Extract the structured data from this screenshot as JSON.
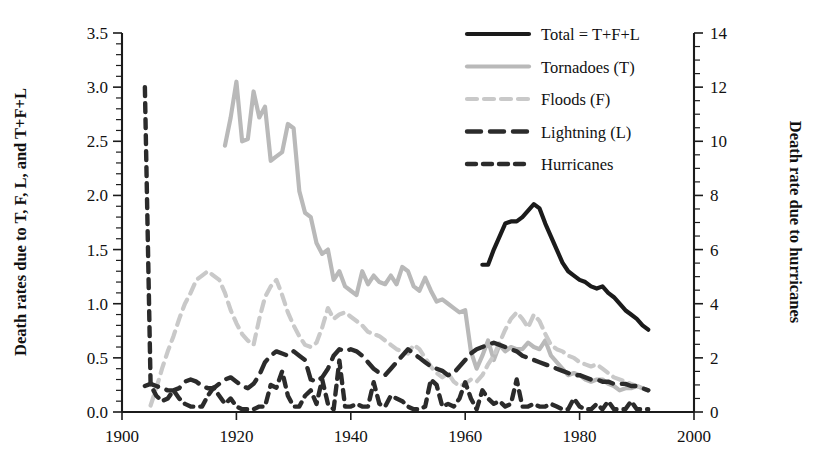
{
  "chart_data": {
    "type": "line",
    "title": "",
    "xlabel": "",
    "ylabel": "Death rates due to T, F, L, and T+F+L",
    "ylabel_right": "Death rate due to hurricanes",
    "xlim": [
      1900,
      2000
    ],
    "ylim": [
      0.0,
      3.5
    ],
    "ylim_right": [
      0,
      14
    ],
    "grid": false,
    "legend_position": "top-right",
    "xticks": [
      1900,
      1920,
      1940,
      1960,
      1980,
      2000
    ],
    "xtick_labels": [
      "1900",
      "1920",
      "1940",
      "1960",
      "1980",
      "2000"
    ],
    "yticks": [
      0.0,
      0.5,
      1.0,
      1.5,
      2.0,
      2.5,
      3.0,
      3.5
    ],
    "ytick_labels": [
      "0.0",
      "0.5",
      "1.0",
      "1.5",
      "2.0",
      "2.5",
      "3.0",
      "3.5"
    ],
    "yticks_right": [
      0,
      2,
      4,
      6,
      8,
      10,
      12,
      14
    ],
    "ytick_labels_right": [
      "0",
      "2",
      "4",
      "6",
      "8",
      "10",
      "12",
      "14"
    ],
    "y_minor_step": 0.1,
    "y_right_minor_step": 0.5,
    "series": [
      {
        "name": "Total = T+F+L",
        "legend_label": "Total = T+F+L",
        "axis": "left",
        "color": "#1b1b1b",
        "width": 4.2,
        "dash": "none",
        "x": [
          1963,
          1964,
          1965,
          1966,
          1967,
          1968,
          1969,
          1970,
          1971,
          1972,
          1973,
          1974,
          1975,
          1976,
          1977,
          1978,
          1979,
          1980,
          1981,
          1982,
          1983,
          1984,
          1985,
          1986,
          1987,
          1988,
          1989,
          1990,
          1991,
          1992
        ],
        "y": [
          1.36,
          1.36,
          1.5,
          1.62,
          1.74,
          1.76,
          1.76,
          1.8,
          1.86,
          1.92,
          1.88,
          1.74,
          1.62,
          1.5,
          1.38,
          1.3,
          1.26,
          1.22,
          1.2,
          1.16,
          1.14,
          1.16,
          1.1,
          1.06,
          1.0,
          0.94,
          0.9,
          0.86,
          0.8,
          0.76
        ]
      },
      {
        "name": "Tornadoes (T)",
        "legend_label": "Tornadoes (T)",
        "axis": "left",
        "color": "#b9b9b9",
        "width": 4.2,
        "dash": "none",
        "x": [
          1918,
          1919,
          1920,
          1921,
          1922,
          1923,
          1924,
          1925,
          1926,
          1927,
          1928,
          1929,
          1930,
          1931,
          1932,
          1933,
          1934,
          1935,
          1936,
          1937,
          1938,
          1939,
          1940,
          1941,
          1942,
          1943,
          1944,
          1945,
          1946,
          1947,
          1948,
          1949,
          1950,
          1951,
          1952,
          1953,
          1954,
          1955,
          1956,
          1957,
          1958,
          1959,
          1960,
          1961,
          1962,
          1963,
          1964,
          1965,
          1966,
          1967,
          1968,
          1969,
          1970,
          1971,
          1972,
          1973,
          1974,
          1975,
          1976,
          1977,
          1978,
          1979,
          1980,
          1981,
          1982,
          1983,
          1984,
          1985,
          1986,
          1987,
          1988,
          1989,
          1990,
          1991,
          1992
        ],
        "y": [
          2.46,
          2.72,
          3.05,
          2.5,
          2.52,
          2.96,
          2.72,
          2.82,
          2.32,
          2.36,
          2.4,
          2.66,
          2.62,
          2.04,
          1.84,
          1.8,
          1.56,
          1.46,
          1.5,
          1.22,
          1.3,
          1.16,
          1.12,
          1.08,
          1.3,
          1.18,
          1.26,
          1.2,
          1.18,
          1.26,
          1.18,
          1.34,
          1.3,
          1.16,
          1.12,
          1.24,
          1.12,
          1.02,
          1.04,
          1.0,
          0.96,
          0.92,
          0.94,
          0.56,
          0.4,
          0.52,
          0.66,
          0.48,
          0.62,
          0.56,
          0.6,
          0.58,
          0.58,
          0.64,
          0.6,
          0.58,
          0.66,
          0.52,
          0.46,
          0.4,
          0.34,
          0.36,
          0.34,
          0.3,
          0.28,
          0.3,
          0.3,
          0.26,
          0.24,
          0.2,
          0.22,
          0.22,
          0.24,
          0.22,
          0.2
        ]
      },
      {
        "name": "Floods (F)",
        "legend_label": "Floods (F)",
        "axis": "left",
        "color": "#c9c9c9",
        "width": 4.2,
        "dash": "10 7",
        "x": [
          1905,
          1906,
          1907,
          1908,
          1909,
          1910,
          1911,
          1912,
          1913,
          1914,
          1915,
          1916,
          1917,
          1918,
          1919,
          1920,
          1921,
          1922,
          1923,
          1924,
          1925,
          1926,
          1927,
          1928,
          1929,
          1930,
          1931,
          1932,
          1933,
          1934,
          1935,
          1936,
          1937,
          1938,
          1939,
          1940,
          1941,
          1942,
          1943,
          1944,
          1945,
          1946,
          1947,
          1948,
          1949,
          1950,
          1951,
          1952,
          1953,
          1954,
          1955,
          1956,
          1957,
          1958,
          1959,
          1960,
          1961,
          1962,
          1963,
          1964,
          1965,
          1966,
          1967,
          1968,
          1969,
          1970,
          1971,
          1972,
          1973,
          1974,
          1975,
          1976,
          1977,
          1978,
          1979,
          1980,
          1981,
          1982,
          1983,
          1984,
          1985,
          1986,
          1987,
          1988,
          1989,
          1990,
          1991,
          1992
        ],
        "y": [
          0.06,
          0.22,
          0.4,
          0.56,
          0.7,
          0.86,
          1.0,
          1.1,
          1.22,
          1.26,
          1.3,
          1.26,
          1.22,
          1.1,
          0.94,
          0.82,
          0.72,
          0.66,
          0.62,
          0.86,
          1.06,
          1.16,
          1.22,
          1.08,
          0.92,
          0.8,
          0.7,
          0.62,
          0.6,
          0.64,
          0.78,
          0.96,
          0.86,
          0.9,
          0.92,
          0.88,
          0.84,
          0.8,
          0.74,
          0.72,
          0.7,
          0.66,
          0.62,
          0.58,
          0.56,
          0.54,
          0.62,
          0.58,
          0.5,
          0.42,
          0.36,
          0.32,
          0.36,
          0.28,
          0.24,
          0.26,
          0.3,
          0.28,
          0.34,
          0.44,
          0.52,
          0.64,
          0.76,
          0.86,
          0.92,
          0.86,
          0.78,
          0.9,
          0.84,
          0.72,
          0.62,
          0.58,
          0.56,
          0.52,
          0.5,
          0.46,
          0.44,
          0.42,
          0.44,
          0.4,
          0.36,
          0.32,
          0.3,
          0.28,
          0.26,
          0.24,
          0.22,
          0.2
        ]
      },
      {
        "name": "Lightning (L)",
        "legend_label": "Lightning (L)",
        "axis": "left",
        "color": "#2b2b2b",
        "width": 4.4,
        "dash": "14 9",
        "x": [
          1904,
          1905,
          1906,
          1907,
          1908,
          1909,
          1910,
          1911,
          1912,
          1913,
          1914,
          1915,
          1916,
          1917,
          1918,
          1919,
          1920,
          1921,
          1922,
          1923,
          1924,
          1925,
          1926,
          1927,
          1928,
          1929,
          1930,
          1931,
          1932,
          1933,
          1934,
          1935,
          1936,
          1937,
          1938,
          1939,
          1940,
          1941,
          1942,
          1943,
          1944,
          1945,
          1946,
          1947,
          1948,
          1949,
          1950,
          1951,
          1952,
          1953,
          1954,
          1955,
          1956,
          1957,
          1958,
          1959,
          1960,
          1961,
          1962,
          1963,
          1964,
          1965,
          1966,
          1967,
          1968,
          1969,
          1970,
          1971,
          1972,
          1973,
          1974,
          1975,
          1976,
          1977,
          1978,
          1979,
          1980,
          1981,
          1982,
          1983,
          1984,
          1985,
          1986,
          1987,
          1988,
          1989,
          1990,
          1991,
          1992
        ],
        "y": [
          0.24,
          0.26,
          0.24,
          0.22,
          0.2,
          0.2,
          0.22,
          0.28,
          0.3,
          0.28,
          0.24,
          0.22,
          0.22,
          0.26,
          0.3,
          0.32,
          0.28,
          0.24,
          0.22,
          0.26,
          0.34,
          0.46,
          0.52,
          0.56,
          0.54,
          0.52,
          0.56,
          0.52,
          0.48,
          0.3,
          0.28,
          0.32,
          0.4,
          0.52,
          0.58,
          0.56,
          0.58,
          0.56,
          0.52,
          0.46,
          0.4,
          0.36,
          0.34,
          0.4,
          0.46,
          0.52,
          0.58,
          0.54,
          0.5,
          0.46,
          0.42,
          0.4,
          0.38,
          0.34,
          0.36,
          0.42,
          0.48,
          0.54,
          0.58,
          0.6,
          0.62,
          0.64,
          0.62,
          0.6,
          0.58,
          0.56,
          0.52,
          0.5,
          0.48,
          0.46,
          0.44,
          0.42,
          0.4,
          0.38,
          0.36,
          0.34,
          0.34,
          0.32,
          0.3,
          0.3,
          0.28,
          0.28,
          0.26,
          0.26,
          0.26,
          0.24,
          0.24,
          0.22,
          0.2
        ]
      },
      {
        "name": "Hurricanes",
        "legend_label": "Hurricanes",
        "axis": "right",
        "color": "#2b2b2b",
        "width": 4.4,
        "dash": "9 7",
        "x": [
          1904,
          1905,
          1906,
          1907,
          1908,
          1909,
          1910,
          1911,
          1912,
          1913,
          1914,
          1915,
          1916,
          1917,
          1918,
          1919,
          1920,
          1921,
          1922,
          1923,
          1924,
          1925,
          1926,
          1927,
          1928,
          1929,
          1930,
          1931,
          1932,
          1933,
          1934,
          1935,
          1936,
          1937,
          1938,
          1939,
          1940,
          1941,
          1942,
          1943,
          1944,
          1945,
          1946,
          1947,
          1948,
          1949,
          1950,
          1951,
          1952,
          1953,
          1954,
          1955,
          1956,
          1957,
          1958,
          1959,
          1960,
          1961,
          1962,
          1963,
          1964,
          1965,
          1966,
          1967,
          1968,
          1969,
          1970,
          1971,
          1972,
          1973,
          1974,
          1975,
          1976,
          1977,
          1978,
          1979,
          1980,
          1981,
          1982,
          1983,
          1984,
          1985,
          1986,
          1987,
          1988,
          1989,
          1990,
          1991,
          1992
        ],
        "y": [
          12.0,
          1.0,
          0.6,
          0.4,
          0.5,
          0.8,
          0.5,
          0.3,
          0.2,
          0.2,
          0.2,
          0.6,
          0.9,
          0.6,
          0.3,
          0.5,
          0.2,
          0.1,
          0.1,
          0.1,
          0.2,
          0.2,
          1.0,
          0.9,
          1.5,
          0.6,
          0.2,
          0.2,
          0.6,
          0.8,
          0.3,
          1.2,
          0.3,
          0.1,
          1.9,
          0.2,
          0.2,
          0.3,
          0.2,
          0.2,
          1.1,
          0.3,
          0.2,
          0.6,
          0.5,
          0.4,
          0.2,
          0.1,
          0.1,
          0.2,
          1.2,
          1.0,
          0.2,
          0.3,
          0.2,
          0.5,
          1.1,
          0.5,
          0.1,
          0.8,
          0.5,
          0.3,
          0.4,
          0.2,
          0.3,
          1.2,
          0.2,
          0.2,
          0.3,
          0.2,
          0.2,
          0.3,
          0.2,
          0.1,
          0.1,
          0.5,
          0.2,
          0.1,
          0.1,
          0.3,
          0.1,
          0.4,
          0.1,
          0.1,
          0.1,
          0.4,
          0.1,
          0.1,
          0.1
        ]
      }
    ]
  },
  "legend": {
    "items": [
      {
        "label": "Total = T+F+L"
      },
      {
        "label": "Tornadoes (T)"
      },
      {
        "label": "Floods (F)"
      },
      {
        "label": "Lightning (L)"
      },
      {
        "label": "Hurricanes"
      }
    ]
  },
  "axes": {
    "left_title": "Death rates due to T, F, L, and T+F+L",
    "right_title": "Death rate due to hurricanes"
  },
  "colors": {
    "total": "#1b1b1b",
    "tornadoes": "#b9b9b9",
    "floods": "#c9c9c9",
    "lightning": "#2b2b2b",
    "hurricanes": "#2b2b2b",
    "axis": "#1b1b1b",
    "background": "#ffffff"
  }
}
